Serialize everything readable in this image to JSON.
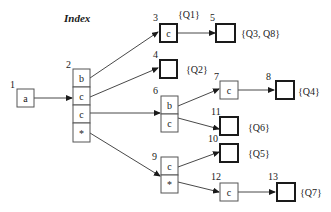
{
  "title": "Index",
  "nodes": {
    "n1": {
      "id": "1",
      "cells": [
        "a"
      ]
    },
    "n2": {
      "id": "2",
      "cells": [
        "b",
        "c",
        "c",
        "*"
      ]
    },
    "n3": {
      "id": "3",
      "cells": [
        "c"
      ],
      "queries": "{Q1}"
    },
    "n4": {
      "id": "4",
      "queries": "{Q2}"
    },
    "n5": {
      "id": "5",
      "queries": "{Q3, Q8}"
    },
    "n6": {
      "id": "6",
      "cells": [
        "b",
        "c"
      ]
    },
    "n7": {
      "id": "7",
      "cells": [
        "c"
      ]
    },
    "n8": {
      "id": "8",
      "queries": "{Q4}"
    },
    "n9": {
      "id": "9",
      "cells": [
        "c",
        "*"
      ]
    },
    "n10": {
      "id": "10",
      "queries": "{Q5}"
    },
    "n11": {
      "id": "11",
      "queries": "{Q6}"
    },
    "n12": {
      "id": "12",
      "cells": [
        "c"
      ]
    },
    "n13": {
      "id": "13",
      "queries": "{Q7}"
    }
  },
  "edges": [
    {
      "from": "1.a",
      "to": "2"
    },
    {
      "from": "2.b",
      "to": "3"
    },
    {
      "from": "2.c",
      "to": "4"
    },
    {
      "from": "2.c2",
      "to": "6"
    },
    {
      "from": "2.*",
      "to": "9"
    },
    {
      "from": "3.c",
      "to": "5"
    },
    {
      "from": "6.b",
      "to": "7"
    },
    {
      "from": "6.c",
      "to": "11"
    },
    {
      "from": "7.c",
      "to": "8"
    },
    {
      "from": "9.c",
      "to": "10"
    },
    {
      "from": "9.*",
      "to": "12"
    },
    {
      "from": "12.c",
      "to": "13"
    }
  ]
}
